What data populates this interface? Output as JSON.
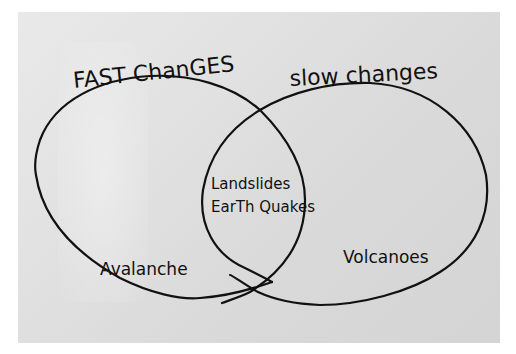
{
  "diagram": {
    "type": "venn",
    "sets": [
      {
        "id": "fast",
        "title": "FAST ChanGES",
        "only_items": [
          "Avalanche"
        ]
      },
      {
        "id": "slow",
        "title": "slow changes",
        "only_items": [
          "Volcanoes"
        ]
      }
    ],
    "intersection_items": [
      "Landslides",
      "EarTh Quakes"
    ],
    "colors": {
      "ink": "#111111",
      "paper": "#e0e0e0",
      "background": "#ffffff"
    }
  },
  "labels": {
    "fast_title": "FAST ChanGES",
    "slow_title": "slow changes",
    "fast_only": "Avalanche",
    "slow_only": "Volcanoes",
    "both_1": "Landslides",
    "both_2": "EarTh Quakes"
  }
}
